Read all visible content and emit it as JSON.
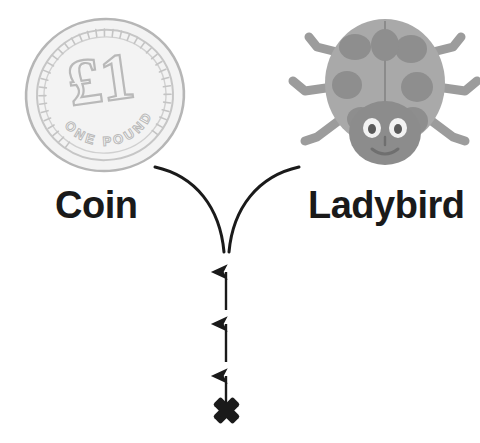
{
  "canvas": {
    "width": 480,
    "height": 443,
    "background": "#ffffff"
  },
  "diagram": {
    "type": "branching-classification",
    "title_visible": false,
    "root_marker": "x-cross-mark",
    "branch_count": 2
  },
  "items": [
    {
      "id": "coin",
      "label": "Coin",
      "icon": "coin-illustration",
      "coin_face": {
        "denomination": "£1",
        "legend": "ONE POUND"
      },
      "colors": {
        "disc_fill": "#f4f4f4",
        "disc_stroke": "#b3b3b3",
        "detail_stroke": "#c2c2c2"
      }
    },
    {
      "id": "ladybird",
      "label": "Ladybird",
      "icon": "ladybird-illustration",
      "colors": {
        "body_fill": "#a9a9a9",
        "spot_fill": "#8e8e8e",
        "head_fill": "#8c8c8c",
        "leg_fill": "#9b9b9b",
        "eye_white": "#f2f2f2",
        "eye_pupil": "#5a5a5a"
      }
    }
  ],
  "connector": {
    "name": "y-branch",
    "stroke": "#1a1a1a",
    "stroke_width": 3,
    "junction": {
      "x": 226,
      "y": 252
    },
    "left_end": {
      "x": 154,
      "y": 167
    },
    "right_end": {
      "x": 300,
      "y": 167
    }
  },
  "arrows": {
    "name": "upward-arrow-stack",
    "count": 3,
    "color": "#1a1a1a",
    "direction": "up",
    "x": 226,
    "segments": [
      {
        "tip_y": 262,
        "tail_y": 310
      },
      {
        "tip_y": 315,
        "tail_y": 363
      },
      {
        "tip_y": 366,
        "tail_y": 408
      }
    ]
  },
  "cross_mark": {
    "name": "x-cross-mark",
    "symbol": "✖",
    "color": "#1a1a1a",
    "x": 226,
    "y": 420,
    "size": 30
  },
  "colors": {
    "ink": "#1a1a1a",
    "background": "#ffffff",
    "gray_mid": "#a9a9a9",
    "gray_dark": "#8e8e8e",
    "gray_light": "#f4f4f4"
  }
}
